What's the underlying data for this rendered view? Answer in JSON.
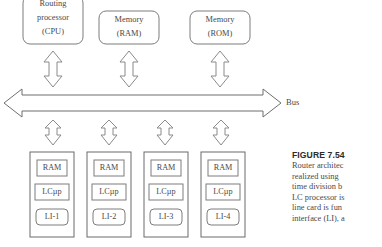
{
  "figure": {
    "number": "FIGURE 7.54",
    "caption_lines": [
      "Router architec",
      "realized using",
      "time division b",
      "LC processor is",
      "line card is fun",
      "interface (LI), a"
    ]
  },
  "diagram": {
    "bus_label": "Bus",
    "top_modules": [
      {
        "id": "routing-processor",
        "lines": [
          "Routing",
          "processor",
          "(CPU)"
        ]
      },
      {
        "id": "memory-ram",
        "lines": [
          "Memory",
          "(RAM)"
        ]
      },
      {
        "id": "memory-rom",
        "lines": [
          "Memory",
          "(ROM)"
        ]
      }
    ],
    "line_cards": [
      {
        "id": "line-card-1",
        "ram": "RAM",
        "proc": "LCµp",
        "li": "LI-1"
      },
      {
        "id": "line-card-2",
        "ram": "RAM",
        "proc": "LCµp",
        "li": "LI-2"
      },
      {
        "id": "line-card-3",
        "ram": "RAM",
        "proc": "LCµp",
        "li": "LI-3"
      },
      {
        "id": "line-card-4",
        "ram": "RAM",
        "proc": "LCµp",
        "li": "LI-4"
      }
    ],
    "colors": {
      "stroke": "#7d7d7d",
      "text": "#4a4a4a",
      "background": "#ffffff",
      "caption_title": "#2b2b2b"
    }
  }
}
